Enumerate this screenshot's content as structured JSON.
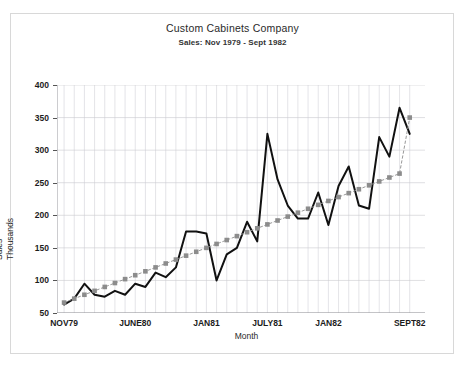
{
  "chart_data": {
    "type": "line",
    "title": "Custom Cabinets Company",
    "subtitle": "Sales: Nov 1979 - Sept 1982",
    "xlabel": "Month",
    "ylabel": "Sales Thousands",
    "ylabel_lines": [
      "Sales",
      "Thousands"
    ],
    "ylim": [
      50,
      400
    ],
    "yticks": [
      50,
      100,
      150,
      200,
      250,
      300,
      350,
      400
    ],
    "ytick_labels": [
      "50",
      "100",
      "150",
      "200",
      "250",
      "300",
      "350",
      "400"
    ],
    "grid": true,
    "legend": "none",
    "xtick_labels": [
      "NOV79",
      "JUNE80",
      "JAN81",
      "JULY81",
      "JAN82",
      "SEPT82"
    ],
    "xtick_indices": [
      0,
      7,
      14,
      20,
      26,
      34
    ],
    "x": [
      "Nov79",
      "Dec79",
      "Jan80",
      "Feb80",
      "Mar80",
      "Apr80",
      "May80",
      "Jun80",
      "Jul80",
      "Aug80",
      "Sep80",
      "Oct80",
      "Nov80",
      "Dec80",
      "Jan81",
      "Feb81",
      "Mar81",
      "Apr81",
      "May81",
      "Jun81",
      "Jul81",
      "Aug81",
      "Sep81",
      "Oct81",
      "Nov81",
      "Dec81",
      "Jan82",
      "Feb82",
      "Mar82",
      "Apr82",
      "May82",
      "Jun82",
      "Jul82",
      "Aug82",
      "Sep82"
    ],
    "series": [
      {
        "name": "Actual Sales",
        "color": "#111111",
        "marker": "none",
        "style": "solid",
        "values": [
          63,
          72,
          95,
          78,
          75,
          84,
          78,
          95,
          90,
          112,
          105,
          120,
          175,
          175,
          172,
          100,
          140,
          150,
          190,
          160,
          325,
          255,
          215,
          195,
          195,
          235,
          185,
          245,
          275,
          215,
          210,
          320,
          290,
          365,
          325
        ]
      },
      {
        "name": "Trend",
        "color": "#8c8c8c",
        "marker": "square",
        "style": "dashed",
        "values": [
          66,
          72,
          78,
          84,
          90,
          96,
          102,
          108,
          114,
          120,
          126,
          132,
          138,
          144,
          150,
          156,
          162,
          168,
          174,
          180,
          186,
          192,
          198,
          204,
          210,
          216,
          222,
          228,
          234,
          240,
          246,
          252,
          258,
          264,
          350
        ]
      }
    ]
  }
}
